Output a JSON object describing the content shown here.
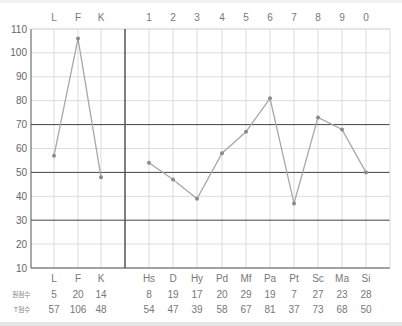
{
  "chart_data": {
    "type": "line",
    "title": "",
    "xlabel": "",
    "ylabel": "",
    "ylim": [
      10,
      110
    ],
    "yticks": [
      10,
      20,
      30,
      40,
      50,
      60,
      70,
      80,
      90,
      100,
      110
    ],
    "highlight_lines": [
      30,
      50,
      70
    ],
    "grid": true,
    "top_labels": [
      "L",
      "F",
      "K",
      "1",
      "2",
      "3",
      "4",
      "5",
      "6",
      "7",
      "8",
      "9",
      "0"
    ],
    "categories": [
      "L",
      "F",
      "K",
      "Hs",
      "D",
      "Hy",
      "Pd",
      "Mf",
      "Pa",
      "Pt",
      "Sc",
      "Ma",
      "Si"
    ],
    "groups": [
      {
        "name": "validity",
        "categories": [
          "L",
          "F",
          "K"
        ]
      },
      {
        "name": "clinical",
        "categories": [
          "Hs",
          "D",
          "Hy",
          "Pd",
          "Mf",
          "Pa",
          "Pt",
          "Sc",
          "Ma",
          "Si"
        ]
      }
    ],
    "series": [
      {
        "name": "T점수",
        "values": [
          57,
          106,
          48,
          54,
          47,
          39,
          58,
          67,
          81,
          37,
          73,
          68,
          50
        ]
      }
    ],
    "table": {
      "rows": [
        {
          "label": "원점수",
          "values": [
            5,
            20,
            14,
            8,
            19,
            17,
            20,
            29,
            19,
            7,
            27,
            23,
            28
          ]
        },
        {
          "label": "T점수",
          "values": [
            57,
            106,
            48,
            54,
            47,
            39,
            58,
            67,
            81,
            37,
            73,
            68,
            50
          ]
        }
      ]
    },
    "colors": {
      "line": "#a8a8a8",
      "marker": "#8a8a8a",
      "grid": "#dcdcdc",
      "highlight": "#444444",
      "axis": "#555555"
    }
  }
}
